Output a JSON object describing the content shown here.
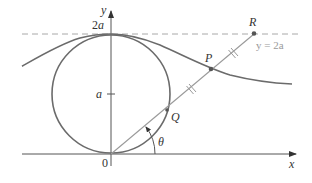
{
  "figure": {
    "type": "witch-of-agnesi-construction",
    "axes": {
      "x_label": "x",
      "y_label": "y",
      "origin_label": "0",
      "y_ticks": [
        {
          "label": "a",
          "value": "a"
        },
        {
          "label": "2a",
          "value": "2a"
        }
      ]
    },
    "asymptote_line": {
      "label": "y = 2a",
      "style": "dashed"
    },
    "points": [
      {
        "name": "R",
        "label": "R"
      },
      {
        "name": "P",
        "label": "P"
      },
      {
        "name": "Q",
        "label": "Q"
      }
    ],
    "angle_label": "θ",
    "circle": {
      "center": "(0, a)",
      "radius": "a"
    },
    "colors": {
      "curve": "#6b6b6b",
      "axis": "#555555",
      "ray": "#9a9a9a",
      "dashed": "#a8a8a8",
      "label_muted": "#9a9a9a"
    }
  }
}
